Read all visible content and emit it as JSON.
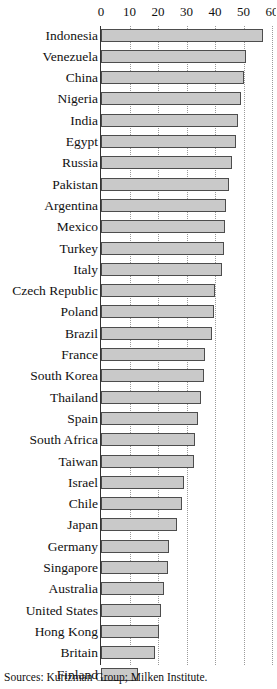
{
  "chart_data": {
    "type": "bar",
    "orientation": "horizontal",
    "title": "",
    "subtitle": "",
    "xlabel": "",
    "ylabel": "",
    "xlim": [
      0,
      60
    ],
    "xticks": [
      0,
      10,
      20,
      30,
      40,
      50,
      60
    ],
    "xtick_labels": [
      "0",
      "10",
      "20",
      "30",
      "40",
      "50",
      "60"
    ],
    "grid": true,
    "grid_axis": "x",
    "grid_style": "dotted",
    "legend": null,
    "legend_position": "none",
    "bar_fill_color": "#c9c9c9",
    "bar_edge_color": "#4d4d4d",
    "axis_color": "#333333",
    "grid_color": "#9a9a9a",
    "categories": [
      "Indonesia",
      "Venezuela",
      "China",
      "Nigeria",
      "India",
      "Egypt",
      "Russia",
      "Pakistan",
      "Argentina",
      "Mexico",
      "Turkey",
      "Italy",
      "Czech Republic",
      "Poland",
      "Brazil",
      "France",
      "South Korea",
      "Thailand",
      "Spain",
      "South Africa",
      "Taiwan",
      "Israel",
      "Chile",
      "Japan",
      "Germany",
      "Singapore",
      "Australia",
      "United States",
      "Hong Kong",
      "Britain",
      "Finland"
    ],
    "values": [
      57.0,
      51.0,
      50.0,
      49.0,
      48.0,
      47.5,
      46.0,
      45.0,
      44.0,
      43.5,
      43.0,
      42.5,
      40.0,
      39.5,
      39.0,
      36.5,
      36.0,
      35.0,
      34.0,
      33.0,
      32.5,
      29.0,
      28.5,
      26.5,
      24.0,
      23.5,
      22.0,
      21.0,
      20.5,
      19.0,
      13.0
    ]
  },
  "footer": {
    "source": "Sources: Kurtzman Group; Milken Institute."
  }
}
